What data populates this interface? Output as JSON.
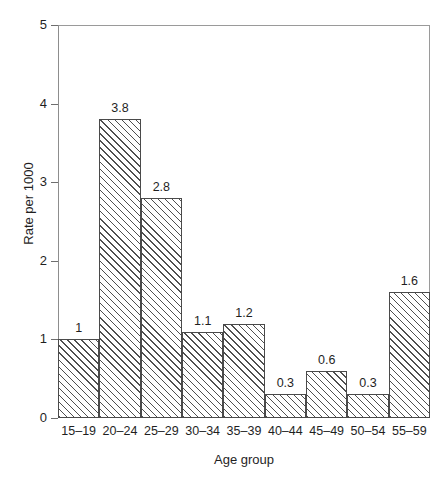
{
  "chart_data": {
    "type": "bar",
    "title": "",
    "subtitle": "",
    "xlabel": "Age group",
    "ylabel": "Rate per 1000",
    "categories": [
      "15–19",
      "20–24",
      "25–29",
      "30–34",
      "35–39",
      "40–44",
      "45–49",
      "50–54",
      "55–59"
    ],
    "values": [
      1,
      3.8,
      2.8,
      1.1,
      1.2,
      0.3,
      0.6,
      0.3,
      1.6
    ],
    "value_labels": [
      "1",
      "3.8",
      "2.8",
      "1.1",
      "1.2",
      "0.3",
      "0.6",
      "0.3",
      "1.6"
    ],
    "ylim": [
      0,
      5
    ],
    "y_ticks": [
      0,
      1,
      2,
      3,
      4,
      5
    ],
    "y_tick_labels": [
      "0",
      "1",
      "2",
      "3",
      "4",
      "5"
    ],
    "grid": false,
    "legend": null,
    "bar_style": "diagonal-hatch",
    "bar_gap": 0,
    "colors": {
      "bar_fill": "#ffffff",
      "bar_hatch": "#4f4f4f",
      "bar_edge": "#4a4a4a",
      "axis": "#6e6e6e",
      "frame": "#9a9a9a",
      "text": "#1f1f1f",
      "background": "#ffffff"
    }
  }
}
